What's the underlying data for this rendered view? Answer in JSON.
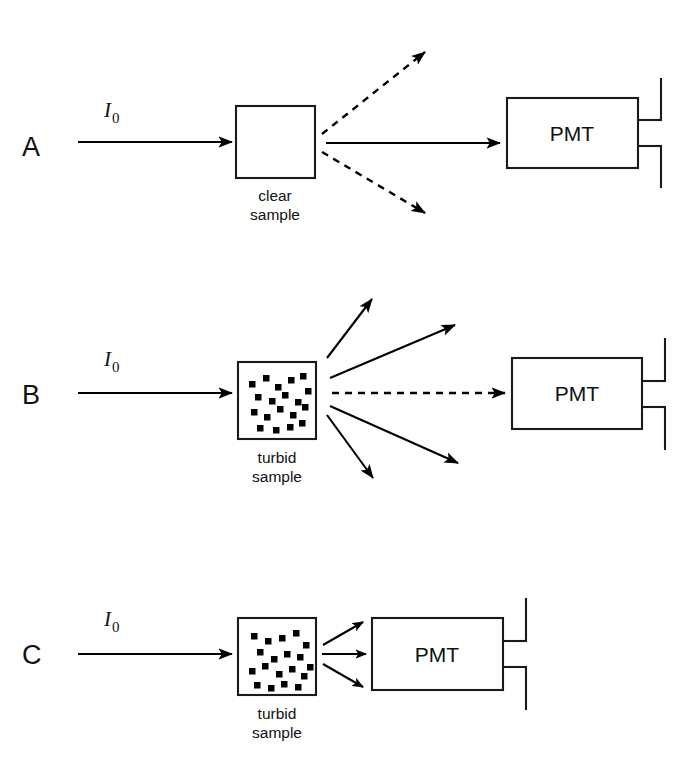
{
  "figure": {
    "background": "#ffffff",
    "ink": "#000000",
    "width": 695,
    "height": 761
  },
  "panels": [
    {
      "id": "A",
      "label": "A",
      "beam_label_main": "I",
      "beam_label_sub": "0",
      "sample_caption_line1": "clear",
      "sample_caption_line2": "sample",
      "sample_type": "clear",
      "detector_label": "PMT",
      "particle_count": 0,
      "transmitted_ray_style": "solid",
      "scattered_ray_style": "dashed",
      "scattered_ray_count": 2,
      "description": "Clear sample: full transmitted beam reaches the PMT; negligible dashed scatter off axis."
    },
    {
      "id": "B",
      "label": "B",
      "beam_label_main": "I",
      "beam_label_sub": "0",
      "sample_caption_line1": "turbid",
      "sample_caption_line2": "sample",
      "sample_type": "turbid",
      "detector_label": "PMT",
      "particle_count": 19,
      "transmitted_ray_style": "dashed",
      "scattered_ray_style": "solid",
      "scattered_ray_count": 4,
      "description": "Turbid sample at a distance: most light is scattered away (solid arrows); only a weak dashed beam reaches the distant PMT."
    },
    {
      "id": "C",
      "label": "C",
      "beam_label_main": "I",
      "beam_label_sub": "0",
      "sample_caption_line1": "turbid",
      "sample_caption_line2": "sample",
      "sample_type": "turbid",
      "detector_label": "PMT",
      "particle_count": 19,
      "transmitted_ray_style": "solid",
      "scattered_ray_style": "solid",
      "scattered_ray_count": 3,
      "description": "Turbid sample with the PMT placed close: transmitted plus forward-scattered light is collected."
    }
  ],
  "geometry": {
    "particles_b": [
      [
        6,
        13
      ],
      [
        20,
        7
      ],
      [
        32,
        16
      ],
      [
        45,
        9
      ],
      [
        57,
        5
      ],
      [
        12,
        26
      ],
      [
        26,
        30
      ],
      [
        39,
        24
      ],
      [
        52,
        31
      ],
      [
        62,
        20
      ],
      [
        8,
        41
      ],
      [
        21,
        46
      ],
      [
        34,
        38
      ],
      [
        47,
        44
      ],
      [
        59,
        36
      ],
      [
        14,
        57
      ],
      [
        30,
        59
      ],
      [
        44,
        56
      ],
      [
        56,
        52
      ]
    ],
    "particles_c": [
      [
        8,
        9
      ],
      [
        22,
        14
      ],
      [
        36,
        11
      ],
      [
        50,
        6
      ],
      [
        60,
        18
      ],
      [
        14,
        25
      ],
      [
        28,
        32
      ],
      [
        41,
        27
      ],
      [
        54,
        30
      ],
      [
        64,
        40
      ],
      [
        6,
        44
      ],
      [
        19,
        39
      ],
      [
        33,
        47
      ],
      [
        46,
        42
      ],
      [
        58,
        49
      ],
      [
        11,
        58
      ],
      [
        25,
        61
      ],
      [
        38,
        57
      ],
      [
        52,
        60
      ]
    ],
    "particle_size": 6.5
  }
}
